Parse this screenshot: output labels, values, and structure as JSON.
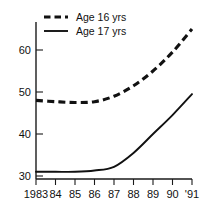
{
  "chart_data": {
    "type": "line",
    "title": "",
    "subtitle": "",
    "xlabel": "",
    "ylabel": "",
    "xlim": [
      1983,
      1991
    ],
    "ylim": [
      29,
      67
    ],
    "grid": false,
    "legend_position": "top-left",
    "x": [
      1983,
      1984,
      1985,
      1986,
      1987,
      1988,
      1989,
      1990,
      1991
    ],
    "categories": [
      "1983",
      "84",
      "85",
      "86",
      "87",
      "88",
      "89",
      "90",
      "'91"
    ],
    "xticklabels": [
      "1983",
      "84",
      "85",
      "86",
      "87",
      "88",
      "89",
      "90",
      "'91"
    ],
    "yticks": [
      30,
      40,
      50,
      60
    ],
    "yticklabels": [
      "30",
      "40",
      "50",
      "60"
    ],
    "series": [
      {
        "name": "Age 16 yrs",
        "style": "dashed",
        "color": "#111111",
        "values": [
          48.0,
          47.7,
          47.5,
          47.7,
          49.0,
          51.5,
          55.0,
          59.5,
          65.0
        ]
      },
      {
        "name": "Age 17 yrs",
        "style": "solid",
        "color": "#111111",
        "values": [
          31.0,
          31.0,
          31.0,
          31.3,
          32.2,
          35.5,
          40.0,
          44.5,
          49.5
        ]
      }
    ]
  },
  "legend": {
    "items": [
      {
        "label": "Age 16 yrs",
        "style": "dashed"
      },
      {
        "label": "Age 17 yrs",
        "style": "solid"
      }
    ]
  },
  "axes": {
    "y": {
      "labels": [
        "60",
        "50",
        "40",
        "30"
      ]
    },
    "x": {
      "labels": [
        "1983",
        "84",
        "85",
        "86",
        "87",
        "88",
        "89",
        "90",
        "'91"
      ]
    }
  }
}
